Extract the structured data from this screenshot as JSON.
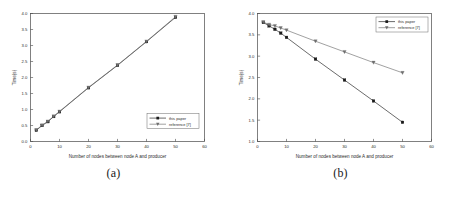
{
  "figure": {
    "panels": [
      {
        "caption": "(a)",
        "xlabel": "Number of nodes between node A and producer",
        "ylabel": "Time(s)",
        "legend": [
          "this paper",
          "reference [7]"
        ]
      },
      {
        "caption": "(b)",
        "xlabel": "Number of nodes between node A and producer",
        "ylabel": "Time(s)",
        "legend": [
          "this paper",
          "reference [7]"
        ]
      }
    ]
  },
  "colors": {
    "series_this_paper": "#1a1a1a",
    "series_reference": "#6e6e6e",
    "frame": "#4a4a4a",
    "text": "#2b2b2b",
    "background": "#ffffff"
  },
  "chart_data": [
    {
      "type": "line",
      "panel": "(a)",
      "title": "",
      "xlabel": "Number of nodes between node A and producer",
      "ylabel": "Time(s)",
      "xlim": [
        0,
        60
      ],
      "ylim": [
        0.0,
        4.0
      ],
      "xticks": [
        0,
        10,
        20,
        30,
        40,
        50,
        60
      ],
      "yticks": [
        0.0,
        0.5,
        1.0,
        1.5,
        2.0,
        2.5,
        3.0,
        3.5,
        4.0
      ],
      "xticklabels": [
        "0",
        "10",
        "20",
        "30",
        "40",
        "50",
        "60"
      ],
      "yticklabels": [
        "0.0",
        "0.5",
        "1.0",
        "1.5",
        "2.0",
        "2.5",
        "3.0",
        "3.5",
        "4.0"
      ],
      "grid": false,
      "legend_position": "lower right",
      "x": [
        2,
        4,
        6,
        8,
        10,
        20,
        30,
        40,
        50
      ],
      "series": [
        {
          "name": "this paper",
          "marker": "square",
          "values": [
            0.35,
            0.5,
            0.62,
            0.78,
            0.93,
            1.68,
            2.38,
            3.12,
            3.88
          ]
        },
        {
          "name": "reference [7]",
          "marker": "triangle-down",
          "values": [
            0.36,
            0.51,
            0.63,
            0.79,
            0.94,
            1.69,
            2.39,
            3.13,
            3.9
          ]
        }
      ]
    },
    {
      "type": "line",
      "panel": "(b)",
      "title": "",
      "xlabel": "Number of nodes between node A and producer",
      "ylabel": "Time(s)",
      "xlim": [
        0,
        60
      ],
      "ylim": [
        1.0,
        4.0
      ],
      "xticks": [
        0,
        10,
        20,
        30,
        40,
        50,
        60
      ],
      "yticks": [
        1.0,
        1.5,
        2.0,
        2.5,
        3.0,
        3.5,
        4.0
      ],
      "xticklabels": [
        "0",
        "10",
        "20",
        "30",
        "40",
        "50",
        "60"
      ],
      "yticklabels": [
        "1.0",
        "1.5",
        "2.0",
        "2.5",
        "3.0",
        "3.5",
        "4.0"
      ],
      "grid": false,
      "legend_position": "upper right",
      "x": [
        2,
        4,
        6,
        8,
        10,
        20,
        30,
        40,
        50
      ],
      "series": [
        {
          "name": "this paper",
          "marker": "square",
          "values": [
            3.79,
            3.71,
            3.63,
            3.54,
            3.44,
            2.93,
            2.44,
            1.95,
            1.45
          ]
        },
        {
          "name": "reference [7]",
          "marker": "triangle-down",
          "values": [
            3.8,
            3.74,
            3.71,
            3.66,
            3.61,
            3.35,
            3.1,
            2.85,
            2.61
          ]
        }
      ]
    }
  ]
}
